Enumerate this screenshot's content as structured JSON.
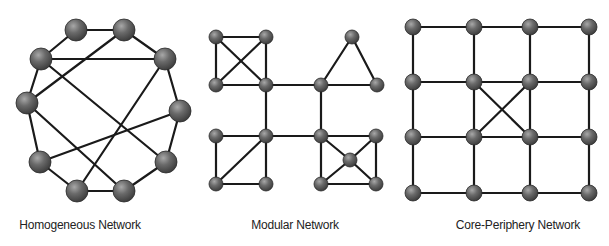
{
  "figure": {
    "node_color": "#5e5e5e",
    "edge_color": "#1a1a1a",
    "panels": [
      {
        "id": "homogeneous",
        "label": "Homogeneous Network",
        "label_x": 80,
        "node_radius": 11,
        "nodes": [
          {
            "id": "A",
            "x": 76,
            "y": 30
          },
          {
            "id": "B",
            "x": 124,
            "y": 30
          },
          {
            "id": "C",
            "x": 41,
            "y": 59
          },
          {
            "id": "D",
            "x": 165,
            "y": 59
          },
          {
            "id": "E",
            "x": 27,
            "y": 103
          },
          {
            "id": "F",
            "x": 180,
            "y": 111
          },
          {
            "id": "G",
            "x": 40,
            "y": 162
          },
          {
            "id": "H",
            "x": 166,
            "y": 162
          },
          {
            "id": "I",
            "x": 77,
            "y": 191
          },
          {
            "id": "J",
            "x": 124,
            "y": 191
          }
        ],
        "edges": [
          [
            "A",
            "B"
          ],
          [
            "A",
            "C"
          ],
          [
            "B",
            "D"
          ],
          [
            "B",
            "E"
          ],
          [
            "C",
            "D"
          ],
          [
            "C",
            "E"
          ],
          [
            "C",
            "H"
          ],
          [
            "D",
            "F"
          ],
          [
            "D",
            "I"
          ],
          [
            "E",
            "G"
          ],
          [
            "E",
            "J"
          ],
          [
            "F",
            "H"
          ],
          [
            "F",
            "G"
          ],
          [
            "G",
            "I"
          ],
          [
            "I",
            "J"
          ],
          [
            "J",
            "H"
          ]
        ]
      },
      {
        "id": "modular",
        "label": "Modular Network",
        "label_x": 295,
        "node_radius": 7,
        "nodes": [
          {
            "id": "m1",
            "x": 216,
            "y": 37
          },
          {
            "id": "m2",
            "x": 266,
            "y": 37
          },
          {
            "id": "m3",
            "x": 216,
            "y": 85
          },
          {
            "id": "m4",
            "x": 266,
            "y": 85
          },
          {
            "id": "m5",
            "x": 352,
            "y": 37
          },
          {
            "id": "m6",
            "x": 321,
            "y": 85
          },
          {
            "id": "m7",
            "x": 377,
            "y": 85
          },
          {
            "id": "m8",
            "x": 216,
            "y": 136
          },
          {
            "id": "m9",
            "x": 266,
            "y": 136
          },
          {
            "id": "m10",
            "x": 216,
            "y": 184
          },
          {
            "id": "m11",
            "x": 266,
            "y": 184
          },
          {
            "id": "m12",
            "x": 321,
            "y": 136
          },
          {
            "id": "m13",
            "x": 376,
            "y": 136
          },
          {
            "id": "m14",
            "x": 321,
            "y": 184
          },
          {
            "id": "m15",
            "x": 376,
            "y": 184
          },
          {
            "id": "m16",
            "x": 350,
            "y": 160
          }
        ],
        "edges": [
          [
            "m1",
            "m2"
          ],
          [
            "m1",
            "m3"
          ],
          [
            "m2",
            "m4"
          ],
          [
            "m3",
            "m4"
          ],
          [
            "m1",
            "m4"
          ],
          [
            "m2",
            "m3"
          ],
          [
            "m5",
            "m6"
          ],
          [
            "m5",
            "m7"
          ],
          [
            "m6",
            "m7"
          ],
          [
            "m8",
            "m9"
          ],
          [
            "m8",
            "m10"
          ],
          [
            "m10",
            "m11"
          ],
          [
            "m9",
            "m11"
          ],
          [
            "m9",
            "m10"
          ],
          [
            "m12",
            "m13"
          ],
          [
            "m12",
            "m14"
          ],
          [
            "m13",
            "m15"
          ],
          [
            "m14",
            "m15"
          ],
          [
            "m12",
            "m16"
          ],
          [
            "m13",
            "m16"
          ],
          [
            "m14",
            "m16"
          ],
          [
            "m15",
            "m16"
          ],
          [
            "m4",
            "m6"
          ],
          [
            "m4",
            "m9"
          ],
          [
            "m6",
            "m12"
          ],
          [
            "m9",
            "m12"
          ]
        ]
      },
      {
        "id": "core-periphery",
        "label": "Core-Periphery Network",
        "label_x": 518,
        "node_radius": 8,
        "grid_x": [
          413,
          474,
          530,
          589
        ],
        "grid_y": [
          27,
          82,
          137,
          193
        ],
        "core_cross": [
          [
            1,
            1,
            2,
            2
          ],
          [
            2,
            1,
            1,
            2
          ]
        ]
      }
    ]
  }
}
